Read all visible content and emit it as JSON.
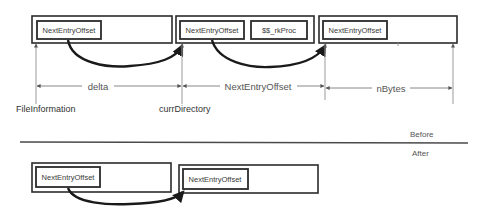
{
  "diagram": {
    "before": {
      "section_label": "Before",
      "entries": [
        {
          "field": "NextEntryOffset"
        },
        {
          "field": "NextEntryOffset",
          "extra_field": "$$_rkProc"
        },
        {
          "field": "NextEntryOffset"
        }
      ],
      "dimensions": [
        {
          "label": "delta"
        },
        {
          "label": "NextEntryOffset"
        },
        {
          "label": "nBytes"
        }
      ],
      "pointers": [
        {
          "label": "FileInformation"
        },
        {
          "label": "currDirectory"
        }
      ]
    },
    "after": {
      "section_label": "After",
      "entries": [
        {
          "field": "NextEntryOffset"
        },
        {
          "field": "NextEntryOffset"
        }
      ]
    },
    "colors": {
      "line": "#2b2b2b",
      "arrow": "#1a1a1a",
      "text": "#3a3a3a",
      "background": "#ffffff"
    }
  }
}
